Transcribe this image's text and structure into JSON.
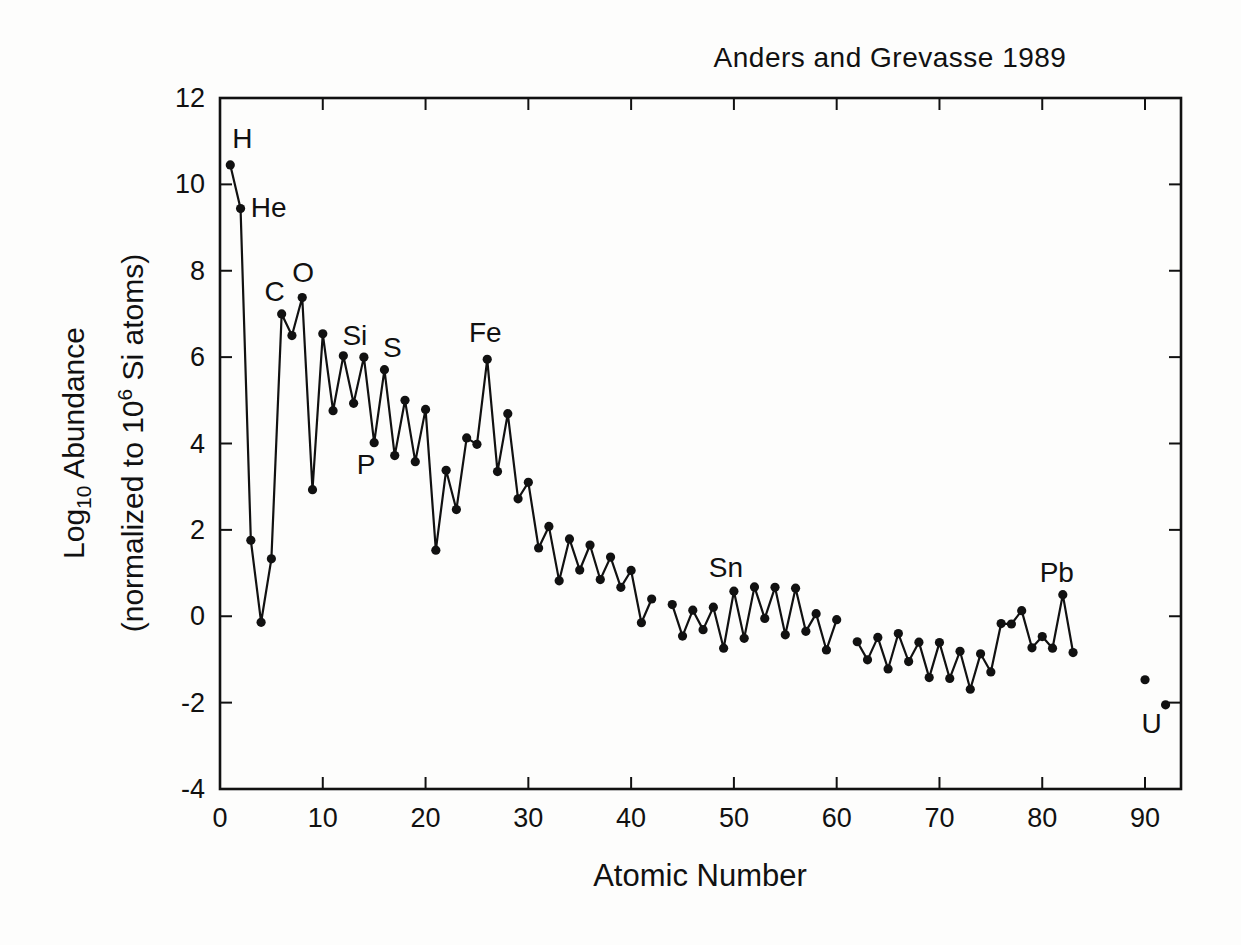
{
  "chart_data": {
    "type": "scatter",
    "title": "Anders and Grevasse 1989",
    "xlabel": "Atomic Number",
    "ylabel_plain": "Log10 Abundance (normalized to 10^6 Si atoms)",
    "ylabel": {
      "line1": {
        "pre": "Log",
        "sub": "10",
        "post": " Abundance"
      },
      "line2": {
        "pre": "(normalized to 10",
        "sup": "6",
        "post": " Si atoms)"
      }
    },
    "xlim": [
      0,
      93.5
    ],
    "ylim": [
      -4,
      12
    ],
    "xticks": [
      0,
      10,
      20,
      30,
      40,
      50,
      60,
      70,
      80,
      90
    ],
    "yticks": [
      -4,
      -2,
      0,
      2,
      4,
      6,
      8,
      10,
      12
    ],
    "grid": false,
    "legend": "none",
    "marker": "filled-circle",
    "line_color": "#111111",
    "marker_color": "#111111",
    "connect_rule": "consecutive atomic numbers only (gaps at Z=43, 61, 84-89, 91 are breaks)",
    "series": [
      {
        "name": "Log10 abundance vs atomic number",
        "points": [
          [
            1,
            10.45
          ],
          [
            2,
            9.44
          ],
          [
            3,
            1.76
          ],
          [
            4,
            -0.14
          ],
          [
            5,
            1.33
          ],
          [
            6,
            7.0
          ],
          [
            7,
            6.5
          ],
          [
            8,
            7.38
          ],
          [
            9,
            2.93
          ],
          [
            10,
            6.54
          ],
          [
            11,
            4.76
          ],
          [
            12,
            6.03
          ],
          [
            13,
            4.93
          ],
          [
            14,
            6.0
          ],
          [
            15,
            4.02
          ],
          [
            16,
            5.71
          ],
          [
            17,
            3.72
          ],
          [
            18,
            5.0
          ],
          [
            19,
            3.58
          ],
          [
            20,
            4.79
          ],
          [
            21,
            1.53
          ],
          [
            22,
            3.38
          ],
          [
            23,
            2.47
          ],
          [
            24,
            4.13
          ],
          [
            25,
            3.98
          ],
          [
            26,
            5.95
          ],
          [
            27,
            3.35
          ],
          [
            28,
            4.69
          ],
          [
            29,
            2.72
          ],
          [
            30,
            3.1
          ],
          [
            31,
            1.58
          ],
          [
            32,
            2.08
          ],
          [
            33,
            0.82
          ],
          [
            34,
            1.79
          ],
          [
            35,
            1.07
          ],
          [
            36,
            1.65
          ],
          [
            37,
            0.85
          ],
          [
            38,
            1.37
          ],
          [
            39,
            0.67
          ],
          [
            40,
            1.06
          ],
          [
            41,
            -0.15
          ],
          [
            42,
            0.4
          ],
          [
            44,
            0.27
          ],
          [
            45,
            -0.46
          ],
          [
            46,
            0.14
          ],
          [
            47,
            -0.31
          ],
          [
            48,
            0.21
          ],
          [
            49,
            -0.74
          ],
          [
            50,
            0.58
          ],
          [
            51,
            -0.51
          ],
          [
            52,
            0.68
          ],
          [
            53,
            -0.05
          ],
          [
            54,
            0.67
          ],
          [
            55,
            -0.43
          ],
          [
            56,
            0.65
          ],
          [
            57,
            -0.35
          ],
          [
            58,
            0.06
          ],
          [
            59,
            -0.78
          ],
          [
            60,
            -0.08
          ],
          [
            62,
            -0.59
          ],
          [
            63,
            -1.01
          ],
          [
            64,
            -0.49
          ],
          [
            65,
            -1.22
          ],
          [
            66,
            -0.4
          ],
          [
            67,
            -1.05
          ],
          [
            68,
            -0.6
          ],
          [
            69,
            -1.42
          ],
          [
            70,
            -0.61
          ],
          [
            71,
            -1.44
          ],
          [
            72,
            -0.81
          ],
          [
            73,
            -1.69
          ],
          [
            74,
            -0.87
          ],
          [
            75,
            -1.29
          ],
          [
            76,
            -0.17
          ],
          [
            77,
            -0.18
          ],
          [
            78,
            0.13
          ],
          [
            79,
            -0.73
          ],
          [
            80,
            -0.47
          ],
          [
            81,
            -0.74
          ],
          [
            82,
            0.5
          ],
          [
            83,
            -0.84
          ],
          [
            90,
            -1.47
          ],
          [
            92,
            -2.05
          ]
        ]
      }
    ],
    "annotations": [
      {
        "label": "H",
        "z": 1,
        "dx": 12,
        "dy": -17
      },
      {
        "label": "He",
        "z": 2,
        "dx": 28,
        "dy": 8
      },
      {
        "label": "C",
        "z": 6,
        "dx": -7,
        "dy": -13
      },
      {
        "label": "O",
        "z": 8,
        "dx": 1,
        "dy": -16
      },
      {
        "label": "Si",
        "z": 14,
        "dx": -9,
        "dy": -12
      },
      {
        "label": "S",
        "z": 16,
        "dx": 8,
        "dy": -13
      },
      {
        "label": "P",
        "z": 15,
        "dx": -8,
        "dy": 31
      },
      {
        "label": "Fe",
        "z": 26,
        "dx": -2,
        "dy": -17
      },
      {
        "label": "Sn",
        "z": 50,
        "dx": -8,
        "dy": -14
      },
      {
        "label": "Pb",
        "z": 82,
        "dx": -6,
        "dy": -13
      },
      {
        "label": "U",
        "z": 92,
        "dx": -14,
        "dy": 28
      }
    ],
    "axis_color": "#111111",
    "background_color": "#fdfdfc"
  }
}
